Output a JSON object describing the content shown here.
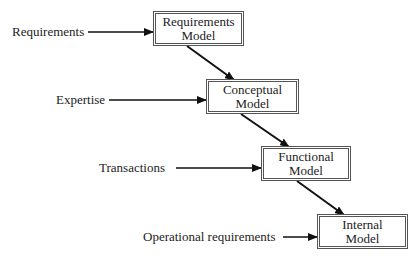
{
  "diagram": {
    "type": "flow",
    "nodes": [
      {
        "id": "requirements-model",
        "line1": "Requirements",
        "line2": "Model"
      },
      {
        "id": "conceptual-model",
        "line1": "Conceptual",
        "line2": "Model"
      },
      {
        "id": "functional-model",
        "line1": "Functional",
        "line2": "Model"
      },
      {
        "id": "internal-model",
        "line1": "Internal",
        "line2": "Model"
      }
    ],
    "inputs": [
      {
        "label": "Requirements",
        "target": "requirements-model"
      },
      {
        "label": "Expertise",
        "target": "conceptual-model"
      },
      {
        "label": "Transactions",
        "target": "functional-model"
      },
      {
        "label": "Operational requirements",
        "target": "internal-model"
      }
    ],
    "edges": [
      {
        "from": "requirements-model",
        "to": "conceptual-model"
      },
      {
        "from": "conceptual-model",
        "to": "functional-model"
      },
      {
        "from": "functional-model",
        "to": "internal-model"
      }
    ]
  }
}
